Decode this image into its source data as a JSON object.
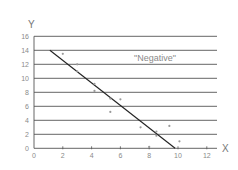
{
  "chart_data": {
    "type": "scatter",
    "title": "",
    "xlabel": "X",
    "ylabel": "Y",
    "annotation": "\"Negative\"",
    "xlim": [
      0,
      12
    ],
    "ylim": [
      0,
      16
    ],
    "x_ticks": [
      0,
      2,
      4,
      6,
      8,
      10,
      12
    ],
    "y_ticks": [
      0,
      2,
      4,
      6,
      8,
      10,
      12,
      14,
      16
    ],
    "grid": {
      "horizontal": true,
      "vertical": false
    },
    "legend": null,
    "series": [
      {
        "name": "points",
        "type": "scatter",
        "x": [
          2.0,
          3.0,
          3.0,
          4.2,
          4.2,
          5.3,
          6.0,
          5.3,
          7.4,
          8.5,
          8.5,
          9.4,
          8.0,
          10.1
        ],
        "y": [
          13.5,
          12.0,
          11.0,
          9.2,
          8.2,
          7.1,
          7.0,
          5.2,
          3.0,
          2.4,
          1.8,
          3.2,
          0.2,
          1.0
        ]
      },
      {
        "name": "trend line",
        "type": "line",
        "x": [
          1.1,
          9.8
        ],
        "y": [
          14.0,
          0.0
        ]
      }
    ]
  },
  "colors": {
    "grid": "#555555",
    "axis": "#555555",
    "line": "#222222",
    "points": "#999999",
    "text": "#8a8a8a"
  }
}
